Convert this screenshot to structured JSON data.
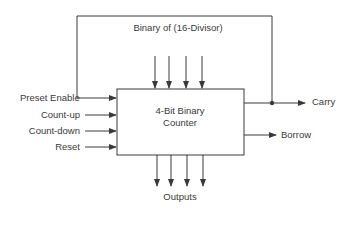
{
  "diagram": {
    "title_top": "Binary of (16-Divisor)",
    "block": {
      "line1": "4-Bit Binary",
      "line2": "Counter"
    },
    "inputs": [
      {
        "label": "Preset Enable"
      },
      {
        "label": "Count-up"
      },
      {
        "label": "Count-down"
      },
      {
        "label": "Reset"
      }
    ],
    "outputs_right": [
      {
        "label": "Carry"
      },
      {
        "label": "Borrow"
      }
    ],
    "outputs_bottom_label": "Outputs",
    "preset_input_count": 4,
    "output_count": 4,
    "colors": {
      "line": "#3a3a3a",
      "background": "#ffffff"
    }
  }
}
